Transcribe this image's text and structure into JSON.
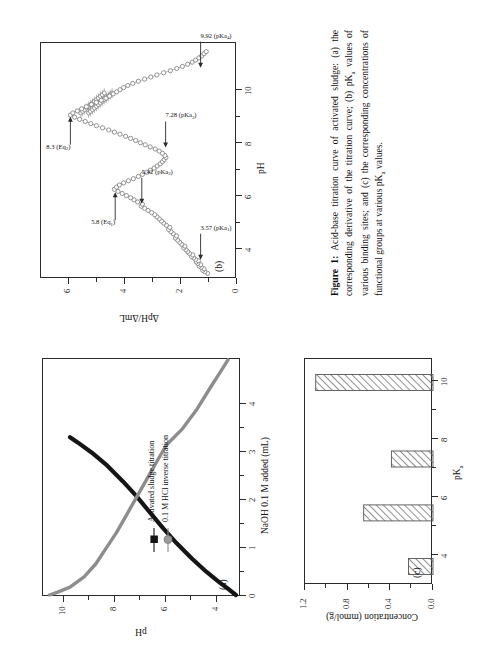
{
  "figure": {
    "caption_label": "Figure 1:",
    "caption_text": " Acid-base titration curve of activated sludge: (a) the corresponding derivative of the titration curve; (b) pK",
    "caption_text2": " values of various binding sites; and (c) the corresponding concentrations of functional groups at various pK",
    "caption_text3": " values.",
    "sub_a": "a"
  },
  "panel_a": {
    "tag": "(a)",
    "xlabel": "NaOH 0.1 M added (mL)",
    "ylabel": "pH",
    "xticks": [
      "0",
      "1",
      "2",
      "3",
      "4"
    ],
    "yticks": [
      "4",
      "6",
      "8",
      "10"
    ],
    "legend": [
      {
        "label": "Activated sludge titration",
        "marker": "square",
        "color": "#151515"
      },
      {
        "label": "0.1 M HCl  inverse titration",
        "marker": "circle",
        "color": "#8c8c8c"
      }
    ]
  },
  "panel_b": {
    "tag": "(b)",
    "xlabel": "pH",
    "ylabel": "ΔpH/ΔmL",
    "xticks": [
      "4",
      "6",
      "8",
      "10"
    ],
    "yticks": [
      "0",
      "2",
      "4",
      "6"
    ],
    "annotations": [
      {
        "text": "3.57 (pKa",
        "sub": "1",
        "tail": ")"
      },
      {
        "text": "5.42 (pKa",
        "sub": "2",
        "tail": ")"
      },
      {
        "text": "7.28 (pKa",
        "sub": "3",
        "tail": ")"
      },
      {
        "text": "9.92 (pKa",
        "sub": "4",
        "tail": ")"
      },
      {
        "text": "5.8 (Eq",
        "sub": "1",
        "tail": ")"
      },
      {
        "text": "8.3 (Eq",
        "sub": "2",
        "tail": ")"
      }
    ]
  },
  "panel_c": {
    "tag": "(c)",
    "xlabel": "pK",
    "xlabel_sub": "a",
    "ylabel": "Concentration (mmol/g)",
    "xticks": [
      "4",
      "6",
      "8",
      "10"
    ],
    "yticks": [
      "0.0",
      "0.4",
      "0.8",
      "1.2"
    ]
  },
  "colors": {
    "black_curve": "#151515",
    "gray_curve": "#8d8d8d",
    "axis": "#2b2b2b",
    "hatch": "#6d6d6d",
    "marker_edge": "#7a7a7a"
  },
  "chart_data": [
    {
      "type": "line",
      "id": "panel_a",
      "title": "(a) Acid-base titration curves",
      "xlabel": "NaOH 0.1 M added (mL)",
      "ylabel": "pH",
      "xlim": [
        0,
        4.6
      ],
      "ylim": [
        2.9,
        10.6
      ],
      "grid": false,
      "legend_position": "center",
      "series": [
        {
          "name": "Activated sludge titration",
          "color": "#151515",
          "x": [
            0.0,
            0.1,
            0.25,
            0.45,
            0.7,
            1.0,
            1.3,
            1.6,
            1.9,
            2.2,
            2.5,
            2.75,
            2.95,
            3.05
          ],
          "y": [
            3.1,
            3.35,
            3.75,
            4.25,
            4.8,
            5.4,
            5.95,
            6.45,
            6.95,
            7.5,
            8.1,
            8.7,
            9.25,
            9.55
          ]
        },
        {
          "name": "0.1 M HCl inverse titration",
          "color": "#8d8d8d",
          "x": [
            0.0,
            0.05,
            0.15,
            0.35,
            0.6,
            0.9,
            1.2,
            1.55,
            1.9,
            2.25,
            2.6,
            2.9,
            3.2,
            3.6,
            4.0,
            4.35,
            4.55
          ],
          "y": [
            10.35,
            10.05,
            9.55,
            9.0,
            8.55,
            8.15,
            7.75,
            7.35,
            6.95,
            6.55,
            6.15,
            5.8,
            5.2,
            4.6,
            4.1,
            3.65,
            3.4
          ]
        }
      ]
    },
    {
      "type": "scatter",
      "id": "panel_b",
      "title": "(b) Derivative of the titration curve",
      "xlabel": "pH",
      "ylabel": "ΔpH/ΔmL",
      "xlim": [
        3.0,
        10.8
      ],
      "ylim": [
        0,
        7.0
      ],
      "grid": false,
      "marker": "open-circle",
      "annotations": [
        {
          "label": "3.57 (pKa1)",
          "x": 3.57,
          "y": 1.3,
          "kind": "pKa"
        },
        {
          "label": "5.42 (pKa2)",
          "x": 5.42,
          "y": 3.4,
          "kind": "pKa"
        },
        {
          "label": "7.28 (pKa3)",
          "x": 7.28,
          "y": 2.55,
          "kind": "pKa"
        },
        {
          "label": "9.92 (pKa4)",
          "x": 9.92,
          "y": 1.3,
          "kind": "pKa"
        },
        {
          "label": "5.8 (Eq1)",
          "x": 5.8,
          "y": 4.35,
          "kind": "Eq"
        },
        {
          "label": "8.3 (Eq2)",
          "x": 8.3,
          "y": 5.95,
          "kind": "Eq"
        }
      ],
      "x": [
        3.12,
        3.18,
        3.22,
        3.27,
        3.32,
        3.36,
        3.41,
        3.45,
        3.5,
        3.54,
        3.58,
        3.63,
        3.68,
        3.73,
        3.78,
        3.84,
        3.9,
        3.96,
        4.02,
        4.08,
        4.15,
        4.22,
        4.29,
        4.36,
        4.43,
        4.5,
        4.57,
        4.64,
        4.71,
        4.78,
        4.85,
        4.92,
        4.99,
        5.06,
        5.13,
        5.2,
        5.27,
        5.34,
        5.41,
        5.48,
        5.55,
        5.62,
        5.69,
        5.76,
        5.83,
        5.9,
        5.97,
        6.04,
        6.11,
        6.18,
        6.25,
        6.32,
        6.39,
        6.46,
        6.53,
        6.6,
        6.67,
        6.74,
        6.81,
        6.88,
        6.95,
        7.02,
        7.09,
        7.16,
        7.23,
        7.3,
        7.37,
        7.44,
        7.51,
        7.58,
        7.65,
        7.72,
        7.79,
        7.86,
        7.93,
        8.0,
        8.07,
        8.14,
        8.21,
        8.28,
        8.35,
        8.42,
        8.49,
        8.56,
        8.63,
        8.7,
        8.77,
        8.84,
        8.91,
        8.98,
        9.05,
        9.12,
        9.19,
        9.26,
        9.33,
        9.4,
        9.47,
        9.54,
        9.61,
        9.68,
        9.75,
        9.82,
        9.89,
        9.96,
        10.03,
        10.1,
        10.17,
        10.24,
        10.31,
        10.38,
        10.45
      ],
      "y": [
        1.05,
        1.15,
        1.22,
        1.18,
        1.28,
        1.35,
        1.3,
        1.4,
        1.45,
        1.38,
        1.48,
        1.55,
        1.62,
        1.58,
        1.7,
        1.76,
        1.82,
        1.9,
        1.86,
        1.98,
        2.05,
        2.12,
        2.2,
        2.16,
        2.28,
        2.36,
        2.44,
        2.4,
        2.52,
        2.62,
        2.7,
        2.78,
        2.86,
        2.94,
        3.05,
        3.18,
        3.3,
        3.42,
        3.38,
        3.55,
        3.68,
        3.8,
        3.95,
        4.1,
        4.25,
        4.38,
        4.3,
        4.2,
        4.05,
        3.88,
        3.7,
        3.52,
        3.38,
        3.22,
        3.1,
        2.96,
        2.85,
        2.74,
        2.66,
        2.6,
        2.54,
        2.58,
        2.66,
        2.78,
        2.92,
        3.1,
        3.28,
        3.45,
        3.62,
        3.8,
        3.98,
        4.18,
        4.38,
        4.58,
        4.8,
        5.02,
        5.22,
        5.42,
        5.62,
        5.8,
        5.95,
        5.86,
        5.7,
        5.55,
        5.38,
        5.2,
        5.02,
        4.85,
        4.68,
        4.55,
        4.42,
        4.3,
        4.18,
        4.05,
        3.9,
        3.72,
        3.52,
        3.3,
        3.08,
        2.86,
        2.62,
        2.38,
        2.15,
        1.95,
        1.76,
        1.6,
        1.48,
        1.36,
        1.26,
        1.18,
        1.1
      ]
    },
    {
      "type": "bar",
      "id": "panel_c",
      "title": "(c) Concentrations of functional groups at various pKa",
      "xlabel": "pKa",
      "ylabel": "Concentration (mmol/g)",
      "orientation": "vertical",
      "xlim": [
        3.0,
        10.8
      ],
      "ylim": [
        0.0,
        1.2
      ],
      "grid": false,
      "categories": [
        "3.57",
        "5.42",
        "7.28",
        "9.92"
      ],
      "values": [
        0.23,
        0.65,
        0.39,
        1.1
      ],
      "bar_style": "hatched"
    }
  ]
}
